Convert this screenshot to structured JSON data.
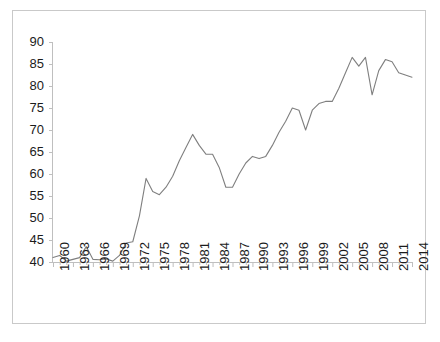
{
  "chart_data": {
    "type": "line",
    "title": "",
    "subtitle": "",
    "xlabel": "",
    "ylabel": "",
    "xlim": [
      1960,
      2014
    ],
    "ylim": [
      40,
      90
    ],
    "grid": false,
    "legend": null,
    "series_color": "#7f7f7f",
    "axis_color": "#bfbfbf",
    "text_color": "#1b1b1b",
    "ytick_labels": [
      "90",
      "85",
      "80",
      "75",
      "70",
      "65",
      "60",
      "55",
      "50",
      "45",
      "40"
    ],
    "ytick_values": [
      90,
      85,
      80,
      75,
      70,
      65,
      60,
      55,
      50,
      45,
      40
    ],
    "xtick_labels": [
      "1960",
      "1963",
      "1966",
      "1969",
      "1972",
      "1975",
      "1978",
      "1981",
      "1984",
      "1987",
      "1990",
      "1993",
      "1996",
      "1999",
      "2002",
      "2005",
      "2008",
      "2011",
      "2014"
    ],
    "xtick_values": [
      1960,
      1963,
      1966,
      1969,
      1972,
      1975,
      1978,
      1981,
      1984,
      1987,
      1990,
      1993,
      1996,
      1999,
      2002,
      2005,
      2008,
      2011,
      2014
    ],
    "x": [
      1960,
      1961,
      1962,
      1963,
      1964,
      1965,
      1966,
      1967,
      1968,
      1969,
      1970,
      1971,
      1972,
      1973,
      1974,
      1975,
      1976,
      1977,
      1978,
      1979,
      1980,
      1981,
      1982,
      1983,
      1984,
      1985,
      1986,
      1987,
      1988,
      1989,
      1990,
      1991,
      1992,
      1993,
      1994,
      1995,
      1996,
      1997,
      1998,
      1999,
      2000,
      2001,
      2002,
      2003,
      2004,
      2005,
      2006,
      2007,
      2008,
      2009,
      2010,
      2011,
      2012,
      2013,
      2014
    ],
    "values": [
      41.0,
      41.5,
      40.2,
      40.6,
      41.0,
      43.5,
      40.6,
      40.5,
      40.7,
      40.2,
      41.5,
      44.3,
      44.6,
      50.5,
      59.0,
      56.0,
      55.3,
      57.0,
      59.5,
      63.0,
      66.0,
      69.0,
      66.5,
      64.5,
      64.5,
      61.5,
      57.0,
      57.0,
      60.0,
      62.5,
      64.0,
      63.5,
      64.0,
      66.5,
      69.5,
      72.0,
      75.0,
      74.5,
      70.0,
      74.5,
      76.0,
      76.5,
      76.5,
      79.5,
      83.0,
      86.5,
      84.5,
      86.5,
      78.0,
      83.5,
      86.0,
      85.5,
      83.0,
      82.5,
      82.0
    ],
    "units": ""
  },
  "figure": {
    "frame_visible": true
  }
}
